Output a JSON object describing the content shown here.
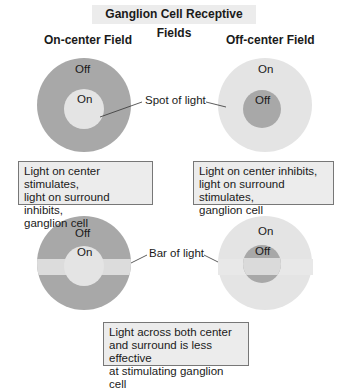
{
  "title": "Ganglion Cell Receptive Fields",
  "headings": {
    "on_center": "On-center Field",
    "off_center": "Off-center Field"
  },
  "fields": {
    "top_left": {
      "center_label": "On",
      "surround_label": "Off"
    },
    "top_right": {
      "center_label": "Off",
      "surround_label": "On"
    },
    "bottom_left": {
      "center_label": "On",
      "surround_label": "Off"
    },
    "bottom_right": {
      "center_label": "Off",
      "surround_label": "On"
    }
  },
  "callouts": {
    "spot": "Spot of light",
    "bar": "Bar of light"
  },
  "captions": {
    "on_center": [
      "Light on center stimulates,",
      "light on surround inhibits,",
      "ganglion cell"
    ],
    "off_center": [
      "Light on center inhibits,",
      "light on surround stimulates,",
      "ganglion cell"
    ],
    "bar": [
      "Light across both center",
      "and surround is less effective",
      "at stimulating ganglion cell"
    ]
  },
  "colors": {
    "dark": "#a8a8a8",
    "light": "#e4e4e4",
    "caption_bg": "#ececec"
  }
}
